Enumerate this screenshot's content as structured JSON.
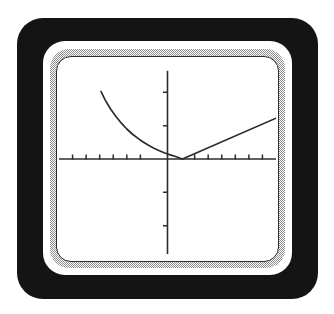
{
  "device": {
    "name": "graphing-calculator-screen",
    "bezel_color": "#141414",
    "ring_color": "#ffffff",
    "shadow_ring_color": "#8d8d8d",
    "outline_color": "#2b2b2b",
    "screen_color": "#ffffff"
  },
  "chart_data": {
    "type": "line",
    "title": "",
    "subtitle": "",
    "xlabel": "",
    "ylabel": "",
    "grid": false,
    "legend": "none",
    "axis_color": "#2b2b2b",
    "curve_color": "#2b2b2b",
    "xlim": [
      -8,
      8
    ],
    "ylim": [
      -6,
      6
    ],
    "x_axis": {
      "visible": true,
      "y_value": 0,
      "x_start": -8,
      "x_end": 8,
      "tick_spacing": 1,
      "tick_values": [
        -7,
        -6,
        -5,
        -4,
        -3,
        -2,
        2,
        3,
        4,
        5,
        6,
        7
      ],
      "tick_labels": []
    },
    "y_axis": {
      "visible": true,
      "x_value": 0,
      "y_start": -5.7,
      "y_end": 5.3,
      "tick_spacing": 2,
      "tick_values": [
        -4,
        -2,
        2,
        4
      ],
      "tick_labels": []
    },
    "series": [
      {
        "name": "curve-left-branch",
        "shape": "decaying-curve",
        "points": [
          [
            -4.9,
            4.05
          ],
          [
            -4.6,
            3.55
          ],
          [
            -4.2,
            3.0
          ],
          [
            -3.8,
            2.55
          ],
          [
            -3.4,
            2.15
          ],
          [
            -3.0,
            1.8
          ],
          [
            -2.6,
            1.5
          ],
          [
            -2.2,
            1.25
          ],
          [
            -1.8,
            1.02
          ],
          [
            -1.4,
            0.82
          ],
          [
            -1.0,
            0.65
          ],
          [
            -0.6,
            0.5
          ],
          [
            -0.2,
            0.36
          ],
          [
            0.2,
            0.25
          ],
          [
            0.6,
            0.15
          ],
          [
            0.9,
            0.06
          ],
          [
            1.1,
            0.0
          ]
        ]
      },
      {
        "name": "line-right-branch",
        "shape": "straight-line",
        "points": [
          [
            1.1,
            0.0
          ],
          [
            8.0,
            2.45
          ]
        ]
      }
    ],
    "annotations": [
      {
        "name": "vertex",
        "x": 1.1,
        "y": 0.0,
        "description": "minimum where curve meets line on the x-axis"
      }
    ]
  }
}
